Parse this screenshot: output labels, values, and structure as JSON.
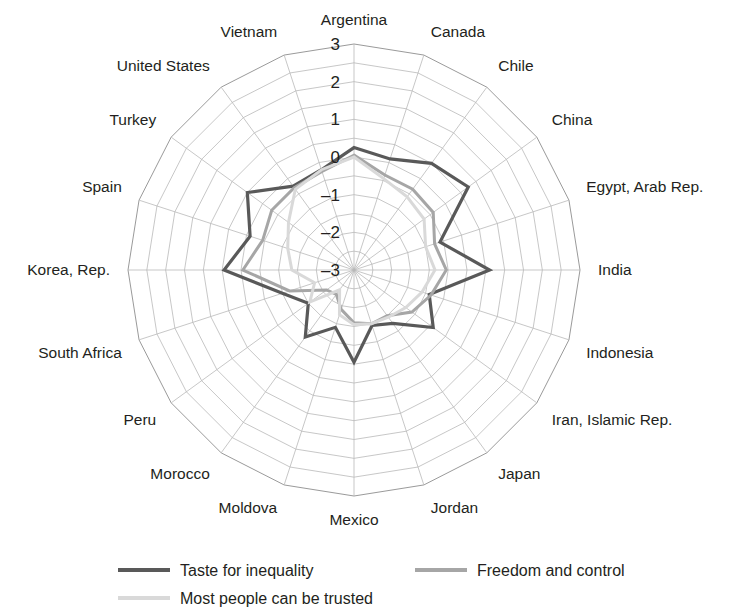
{
  "chart_data": {
    "type": "line",
    "subtype": "radar",
    "title": "",
    "xlabel": "",
    "ylabel": "",
    "grid": true,
    "legend_position": "bottom",
    "rlim": [
      -3,
      3
    ],
    "rticks": [
      3,
      2,
      1,
      0,
      -1,
      -2,
      -3
    ],
    "rtick_labels": [
      "3",
      "2",
      "1",
      "0",
      "–1",
      "–2",
      "–3"
    ],
    "categories": [
      "Argentina",
      "Canada",
      "Chile",
      "China",
      "Egypt, Arab Rep.",
      "India",
      "Indonesia",
      "Iran, Islamic Rep.",
      "Japan",
      "Jordan",
      "Mexico",
      "Moldova",
      "Morocco",
      "Peru",
      "South Africa",
      "Korea, Rep.",
      "Spain",
      "Turkey",
      "United States",
      "Vietnam"
    ],
    "series": [
      {
        "name": "Taste for inequality",
        "color": "#595959",
        "width": 3.2,
        "values": [
          0.25,
          0.1,
          0.5,
          0.75,
          -0.6,
          0.6,
          -0.9,
          -0.4,
          -1.25,
          -1.45,
          -0.55,
          -1.4,
          -0.8,
          -1.5,
          -1.0,
          0.45,
          -0.1,
          0.5,
          -0.25,
          -0.2
        ]
      },
      {
        "name": "Freedom and control",
        "color": "#a6a6a6",
        "width": 3.0,
        "values": [
          0.05,
          -0.35,
          -0.35,
          -0.4,
          -0.75,
          -0.55,
          -0.85,
          -1.1,
          -1.5,
          -1.5,
          -1.6,
          -1.9,
          -2.2,
          -2.1,
          -1.2,
          -0.05,
          -0.45,
          -0.3,
          -0.3,
          -0.25
        ]
      },
      {
        "name": "Most people can be trusted",
        "color": "#d9d9d9",
        "width": 3.0,
        "values": [
          0.0,
          -0.45,
          -0.6,
          -0.7,
          -1.0,
          -0.85,
          -1.1,
          -1.3,
          -1.45,
          -1.5,
          -1.55,
          -1.75,
          -2.35,
          -1.55,
          -1.9,
          -1.35,
          -1.15,
          -0.85,
          -0.35,
          -0.2
        ]
      }
    ]
  },
  "legend": {
    "items": [
      {
        "label": "Taste for inequality",
        "color": "#595959"
      },
      {
        "label": "Freedom and control",
        "color": "#a6a6a6"
      },
      {
        "label": "Most people can be trusted",
        "color": "#d9d9d9"
      }
    ]
  },
  "colors": {
    "background": "#ffffff",
    "text": "#231f20",
    "grid": "#b9b9b9"
  }
}
